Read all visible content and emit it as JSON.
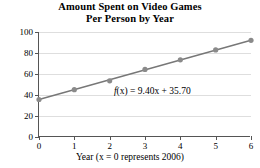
{
  "chart_data": {
    "type": "scatter",
    "title": "Amount Spent on Video Games Per Person by Year",
    "title_line1": "Amount Spent on Video Games",
    "title_line2": "Per Person by Year",
    "xlabel": "Year (x = 0 represents 2006)",
    "ylabel": "Amount Spent ($)",
    "x": [
      0,
      1,
      2,
      3,
      4,
      5,
      6
    ],
    "values": [
      35.7,
      45.1,
      53.5,
      64.4,
      73.5,
      82.9,
      92.1
    ],
    "series": [
      {
        "name": "Amount spent per person",
        "x": [
          0,
          1,
          2,
          3,
          4,
          5,
          6
        ],
        "values": [
          35.7,
          45.1,
          53.5,
          64.4,
          73.5,
          82.9,
          92.1
        ]
      }
    ],
    "trendline": {
      "label": "f(x) = 9.40x + 35.70",
      "label_fx": "f",
      "label_x_paren": "(x)",
      "label_rest": " = 9.40x + 35.70",
      "slope": 9.4,
      "intercept": 35.7
    },
    "xlim": [
      0,
      6
    ],
    "ylim": [
      0,
      100
    ],
    "xticks": [
      "0",
      "1",
      "2",
      "3",
      "4",
      "5",
      "6"
    ],
    "yticks": [
      "0",
      "20",
      "40",
      "60",
      "80",
      "100"
    ],
    "xtick_values": [
      0,
      1,
      2,
      3,
      4,
      5,
      6
    ],
    "ytick_values": [
      0,
      20,
      40,
      60,
      80,
      100
    ],
    "grid": "horizontal",
    "legend": "none",
    "colors": {
      "marker": "#8a8a8a",
      "line": "#777777",
      "grid": "#dedede",
      "axis": "#555555",
      "text": "#000000",
      "background": "#ffffff"
    }
  }
}
